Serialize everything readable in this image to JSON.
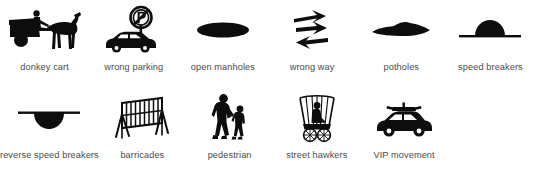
{
  "figure": {
    "background_color": "#ffffff",
    "ink_color": "#0d0d0d",
    "caption_color": "#4a4a4a",
    "columns": 6,
    "rows": 2
  },
  "rows": [
    {
      "items": [
        {
          "icon": "donkey-cart-icon",
          "label": "donkey cart"
        },
        {
          "icon": "no-parking-sign-with-car-icon",
          "label": "wrong parking"
        },
        {
          "icon": "open-manhole-ellipse-icon",
          "label": "open manholes"
        },
        {
          "icon": "wrong-way-arrows-icon",
          "label": "wrong way"
        },
        {
          "icon": "pothole-icon",
          "label": "potholes"
        },
        {
          "icon": "speed-breaker-hump-icon",
          "label": "speed breakers"
        }
      ]
    },
    {
      "items": [
        {
          "icon": "reverse-speed-breaker-dip-icon",
          "label": "reverse speed breakers"
        },
        {
          "icon": "barricade-icon",
          "label": "barricades"
        },
        {
          "icon": "pedestrian-adult-child-icon",
          "label": "pedestrian"
        },
        {
          "icon": "street-hawker-cart-icon",
          "label": "street hawkers"
        },
        {
          "icon": "vip-escort-car-icon",
          "label": "VIP movement"
        }
      ]
    }
  ]
}
